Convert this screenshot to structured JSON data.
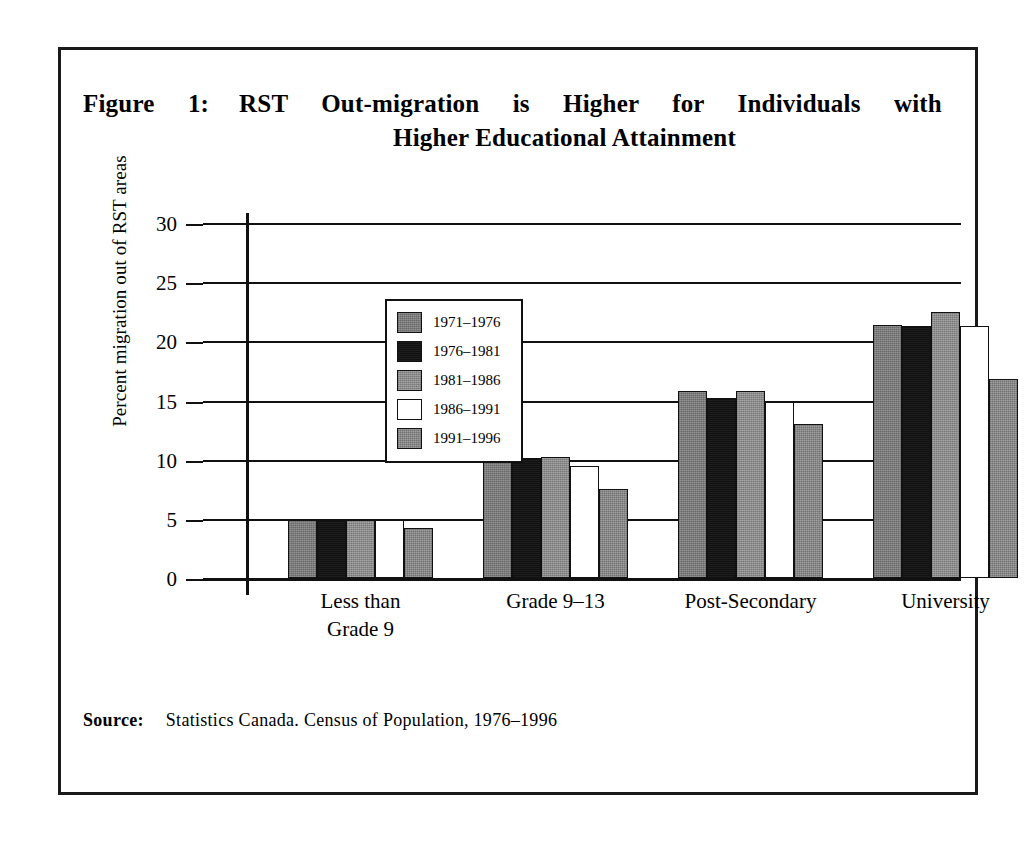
{
  "figure": {
    "label": "Figure 1:",
    "title_line1": "RST Out-migration is Higher for Individuals with",
    "title_line2": "Higher Educational Attainment",
    "source_label": "Source:",
    "source_text": "Statistics Canada. Census of Population, 1976–1996"
  },
  "chart_data": {
    "type": "bar",
    "xlabel": "",
    "ylabel": "Percent migration out of RST areas",
    "ylim": [
      0,
      30
    ],
    "yticks": [
      0,
      5,
      10,
      15,
      20,
      25,
      30
    ],
    "ytick_labels": [
      "0",
      "5",
      "10",
      "15",
      "20",
      "25",
      "30"
    ],
    "grid": true,
    "legend_position": "upper left inside plot",
    "categories": [
      "Less than\nGrade 9",
      "Grade 9–13",
      "Post-Secondary",
      "University"
    ],
    "series": [
      {
        "name": "1971–1976",
        "color": "#7b7b7b",
        "swatch": "sw-gray1",
        "values": [
          4.9,
          10.2,
          15.8,
          21.4
        ]
      },
      {
        "name": "1976–1981",
        "color": "#111111",
        "swatch": "sw-black",
        "values": [
          4.9,
          10.1,
          15.2,
          21.3
        ]
      },
      {
        "name": "1981–1986",
        "color": "#8c8c8c",
        "swatch": "sw-gray2",
        "values": [
          4.9,
          10.2,
          15.8,
          22.5
        ]
      },
      {
        "name": "1986–1991",
        "color": "#ffffff",
        "swatch": "sw-white",
        "values": [
          4.9,
          9.5,
          14.9,
          21.3
        ]
      },
      {
        "name": "1991–1996",
        "color": "#888888",
        "swatch": "sw-gray3",
        "values": [
          4.2,
          7.5,
          13.0,
          16.8
        ]
      }
    ]
  },
  "legend": {
    "items": [
      {
        "label": "1971–1976"
      },
      {
        "label": "1976–1981"
      },
      {
        "label": "1981–1986"
      },
      {
        "label": "1986–1991"
      },
      {
        "label": "1991–1996"
      }
    ]
  }
}
